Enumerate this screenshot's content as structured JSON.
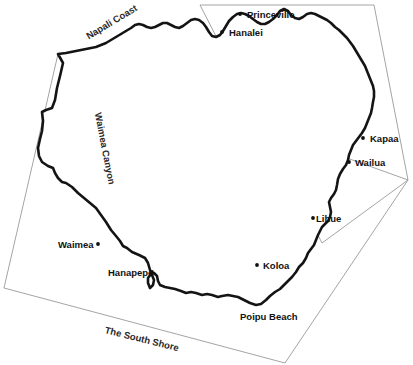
{
  "map": {
    "title": "Kauai",
    "background_color": "#ffffff",
    "coastline_color": "#141414",
    "region_border_color": "#9a9a9a",
    "label_color": "#111111",
    "dot_color": "#111111",
    "places": [
      {
        "name": "Princeville",
        "label": "Princeville",
        "dot_x": 240,
        "dot_y": 14,
        "label_x": 247,
        "label_y": 10,
        "dot_side": "left"
      },
      {
        "name": "Hanalei",
        "label": "Hanalei",
        "dot_x": 222,
        "dot_y": 32,
        "label_x": 229,
        "label_y": 28,
        "dot_side": "left"
      },
      {
        "name": "Kapaa",
        "label": "Kapaa",
        "dot_x": 363,
        "dot_y": 138,
        "label_x": 370,
        "label_y": 134,
        "dot_side": "left"
      },
      {
        "name": "Wailua",
        "label": "Wailua",
        "dot_x": 349,
        "dot_y": 162,
        "label_x": 355,
        "label_y": 158,
        "dot_side": "left"
      },
      {
        "name": "Lihue",
        "label": "Lihue",
        "dot_x": 313,
        "dot_y": 218,
        "label_x": 316,
        "label_y": 214,
        "dot_side": "left"
      },
      {
        "name": "Koloa",
        "label": "Koloa",
        "dot_x": 257,
        "dot_y": 265,
        "label_x": 263,
        "label_y": 261,
        "dot_side": "left"
      },
      {
        "name": "Waimea",
        "label": "Waimea",
        "dot_x": 98,
        "dot_y": 244,
        "label_x": 58,
        "label_y": 240,
        "dot_side": "right"
      },
      {
        "name": "Hanapepe",
        "label": "Hanapepe",
        "dot_x": 152,
        "dot_y": 272,
        "label_x": 108,
        "label_y": 268,
        "dot_side": "right"
      },
      {
        "name": "Poipu Beach",
        "label": "Poipu Beach",
        "dot_x": null,
        "dot_y": null,
        "label_x": 240,
        "label_y": 312,
        "dot_side": "none"
      }
    ],
    "regions": [
      {
        "name": "Napali Coast",
        "label": "Napali Coast",
        "x": 87,
        "y": 32,
        "rotate": -31
      },
      {
        "name": "Waimea Canyon",
        "label": "Waimea Canyon",
        "x": 98,
        "y": 108,
        "rotate": 79
      },
      {
        "name": "The South Shore",
        "label": "The South Shore",
        "x": 105,
        "y": 325,
        "rotate": 14
      }
    ],
    "region_polygons": [
      {
        "name": "north-shore-east-region",
        "points": "200,5 374,5 408,180 322,243"
      },
      {
        "name": "west-side-region",
        "points": "58,54 408,180 285,363 4,288"
      }
    ],
    "coastline_path": "M 58,54 L 63,63 L 60,76 L 57,88 L 55,100 L 52,108 L 46,110 L 42,112 L 43,121 L 42,131 L 40,139 L 38,148 L 39,156 L 42,162 L 48,166 L 53,168 L 55,173 L 58,178 L 62,182 L 66,183 L 72,187 L 78,193 L 84,198 L 90,203 L 96,208 L 101,215 L 106,222 L 111,230 L 116,236 L 120,241 L 123,246 L 127,248 L 132,252 L 139,255 L 145,258 L 148,263 L 150,270 L 152,275 L 154,280 L 153,285 L 150,288 L 148,283 L 148,278 L 151,274 L 154,273 L 157,276 L 158,281 L 160,285 L 165,287 L 170,288 L 175,289 L 181,291 L 186,293 L 191,292 L 196,293 L 202,295 L 207,294 L 212,295 L 218,297 L 222,296 L 228,295 L 233,296 L 238,297 L 244,300 L 250,303 L 256,305 L 261,304 L 266,300 L 270,296 L 275,292 L 280,289 L 284,285 L 288,281 L 292,277 L 296,272 L 299,267 L 303,263 L 306,258 L 308,253 L 311,249 L 314,245 L 316,240 L 318,235 L 320,231 L 322,227 L 325,224 L 328,221 L 330,217 L 331,212 L 330,207 L 329,202 L 331,198 L 334,194 L 336,190 L 337,185 L 338,179 L 340,174 L 343,169 L 346,165 L 348,160 L 349,155 L 351,150 L 353,145 L 356,141 L 359,137 L 362,133 L 365,128 L 367,123 L 369,118 L 371,113 L 372,108 L 373,102 L 374,97 L 374,91 L 373,86 L 371,81 L 369,76 L 367,71 L 365,66 L 362,61 L 359,56 L 356,51 L 353,46 L 350,42 L 347,38 L 343,34 L 339,30 L 335,27 L 331,23 L 327,20 L 323,18 L 319,16 L 315,14 L 311,13 L 307,14 L 303,17 L 299,19 L 295,18 L 291,15 L 288,11 L 284,9 L 280,11 L 277,15 L 273,19 L 269,22 L 265,24 L 261,24 L 257,22 L 253,19 L 249,16 L 245,14 L 241,13 L 237,14 L 233,17 L 229,21 L 226,26 L 223,31 L 220,35 L 216,37 L 212,36 L 209,32 L 206,27 L 203,23 L 199,20 L 195,19 L 191,20 L 187,23 L 183,26 L 179,28 L 175,27 L 171,25 L 167,23 L 163,23 L 159,25 L 155,27 L 151,28 L 147,27 L 143,25 L 139,24 L 135,25 L 131,28 L 126,31 L 121,34 L 116,37 L 111,40 L 106,43 L 101,45 L 96,47 L 91,48 L 86,49 L 81,50 L 76,51 L 71,52 L 66,53 Z"
  }
}
